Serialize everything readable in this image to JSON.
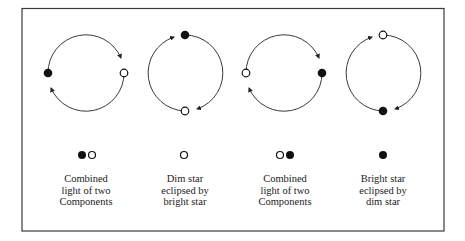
{
  "colors": {
    "stroke": "#3a3a3a",
    "filled_star": "#111111",
    "open_star_fill": "#ffffff",
    "background": "#ffffff"
  },
  "panels": [
    {
      "id": "phase-1",
      "orbit": {
        "cx": 86,
        "cy": 73,
        "r": 38
      },
      "stars": [
        {
          "type": "bright",
          "position": "left",
          "fill": "filled"
        },
        {
          "type": "dim",
          "position": "right",
          "fill": "open"
        }
      ],
      "observed": [
        "filled",
        "open"
      ],
      "caption": [
        "Combined",
        "light of two",
        "Components"
      ]
    },
    {
      "id": "phase-2",
      "orbit": {
        "cx": 185,
        "cy": 73,
        "r": 38
      },
      "stars": [
        {
          "type": "bright",
          "position": "top",
          "fill": "filled"
        },
        {
          "type": "dim",
          "position": "bottom",
          "fill": "open"
        }
      ],
      "observed": [
        "open"
      ],
      "caption": [
        "Dim star",
        "eclipsed by",
        "bright star"
      ]
    },
    {
      "id": "phase-3",
      "orbit": {
        "cx": 284,
        "cy": 73,
        "r": 38
      },
      "stars": [
        {
          "type": "dim",
          "position": "left",
          "fill": "open"
        },
        {
          "type": "bright",
          "position": "right",
          "fill": "filled"
        }
      ],
      "observed": [
        "open",
        "filled"
      ],
      "caption": [
        "Combined",
        "light of two",
        "Components"
      ]
    },
    {
      "id": "phase-4",
      "orbit": {
        "cx": 383,
        "cy": 73,
        "r": 38
      },
      "stars": [
        {
          "type": "dim",
          "position": "top",
          "fill": "open"
        },
        {
          "type": "bright",
          "position": "bottom",
          "fill": "filled"
        }
      ],
      "observed": [
        "filled"
      ],
      "caption": [
        "Bright star",
        "eclipsed by",
        "dim star"
      ]
    }
  ]
}
